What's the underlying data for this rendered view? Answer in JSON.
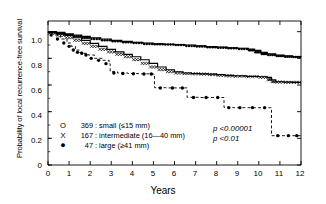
{
  "chart_data": {
    "type": "line",
    "title": "",
    "xlabel": "Years",
    "ylabel": "Probability of local recurrence-free survival",
    "xlim": [
      0,
      12
    ],
    "ylim": [
      0,
      1.08
    ],
    "xticks": [
      "0",
      "1",
      "2",
      "3",
      "4",
      "5",
      "6",
      "7",
      "8",
      "9",
      "10",
      "11",
      "12"
    ],
    "yticks": [
      "0",
      "0.2",
      "0.4",
      "0.6",
      "0.8",
      "1.0"
    ],
    "grid": false,
    "legend_position": "lower-left-inside",
    "series": [
      {
        "name": "small",
        "marker": "O",
        "count": 369,
        "size_range": "≤15 mm",
        "legend_label": "369: small (≤15 mm)",
        "points": [
          [
            0.0,
            1.0
          ],
          [
            0.4,
            0.995
          ],
          [
            0.8,
            0.985
          ],
          [
            1.2,
            0.975
          ],
          [
            1.6,
            0.965
          ],
          [
            2.0,
            0.955
          ],
          [
            2.5,
            0.945
          ],
          [
            3.0,
            0.935
          ],
          [
            3.5,
            0.928
          ],
          [
            4.0,
            0.921
          ],
          [
            4.5,
            0.915
          ],
          [
            5.0,
            0.908
          ],
          [
            5.5,
            0.905
          ],
          [
            6.0,
            0.903
          ],
          [
            6.5,
            0.9
          ],
          [
            7.0,
            0.893
          ],
          [
            7.5,
            0.888
          ],
          [
            8.0,
            0.884
          ],
          [
            8.5,
            0.88
          ],
          [
            9.0,
            0.876
          ],
          [
            9.5,
            0.87
          ],
          [
            9.8,
            0.86
          ],
          [
            10.1,
            0.845
          ],
          [
            10.4,
            0.833
          ],
          [
            10.8,
            0.825
          ],
          [
            11.2,
            0.818
          ],
          [
            11.6,
            0.812
          ],
          [
            12.0,
            0.81
          ]
        ]
      },
      {
        "name": "intermediate",
        "marker": "X",
        "count": 167,
        "size_range": "16—40 mm",
        "legend_label": "167: intermediate (16—40 mm)",
        "points": [
          [
            0.0,
            1.0
          ],
          [
            0.4,
            0.988
          ],
          [
            0.8,
            0.972
          ],
          [
            1.2,
            0.955
          ],
          [
            1.6,
            0.935
          ],
          [
            2.0,
            0.912
          ],
          [
            2.4,
            0.89
          ],
          [
            2.8,
            0.868
          ],
          [
            3.2,
            0.848
          ],
          [
            3.6,
            0.83
          ],
          [
            4.0,
            0.812
          ],
          [
            4.4,
            0.79
          ],
          [
            4.8,
            0.762
          ],
          [
            5.2,
            0.735
          ],
          [
            5.6,
            0.715
          ],
          [
            6.0,
            0.7
          ],
          [
            6.4,
            0.69
          ],
          [
            6.8,
            0.686
          ],
          [
            7.2,
            0.684
          ],
          [
            7.6,
            0.682
          ],
          [
            8.0,
            0.678
          ],
          [
            8.4,
            0.672
          ],
          [
            8.8,
            0.668
          ],
          [
            9.4,
            0.665
          ],
          [
            10.0,
            0.662
          ],
          [
            10.4,
            0.658
          ],
          [
            10.6,
            0.64
          ],
          [
            10.8,
            0.625
          ],
          [
            11.2,
            0.622
          ],
          [
            11.6,
            0.62
          ],
          [
            12.0,
            0.62
          ]
        ]
      },
      {
        "name": "large",
        "marker": "●",
        "count": 47,
        "size_range": "≥41 mm",
        "legend_label": "47: large (≥41 mm)",
        "points": [
          [
            0.0,
            1.0
          ],
          [
            0.3,
            0.975
          ],
          [
            0.6,
            0.945
          ],
          [
            0.9,
            0.915
          ],
          [
            1.1,
            0.89
          ],
          [
            1.3,
            0.862
          ],
          [
            1.5,
            0.845
          ],
          [
            1.7,
            0.838
          ],
          [
            1.9,
            0.825
          ],
          [
            2.2,
            0.8
          ],
          [
            2.6,
            0.785
          ],
          [
            2.9,
            0.76
          ],
          [
            2.95,
            0.7
          ],
          [
            3.3,
            0.69
          ],
          [
            3.8,
            0.686
          ],
          [
            4.3,
            0.684
          ],
          [
            4.8,
            0.682
          ],
          [
            5.0,
            0.682
          ],
          [
            5.05,
            0.58
          ],
          [
            5.6,
            0.578
          ],
          [
            6.2,
            0.578
          ],
          [
            6.55,
            0.578
          ],
          [
            6.6,
            0.508
          ],
          [
            7.2,
            0.506
          ],
          [
            7.8,
            0.506
          ],
          [
            8.3,
            0.506
          ],
          [
            8.35,
            0.432
          ],
          [
            8.8,
            0.43
          ],
          [
            9.4,
            0.43
          ],
          [
            10.0,
            0.43
          ],
          [
            10.55,
            0.43
          ],
          [
            10.6,
            0.22
          ],
          [
            11.2,
            0.22
          ],
          [
            12.0,
            0.22
          ]
        ]
      }
    ],
    "annotations": [
      {
        "text": "p <0.00001",
        "x": 8.35,
        "y": 0.3
      },
      {
        "text": "p <0.01",
        "x": 8.35,
        "y": 0.235
      }
    ]
  },
  "legend": {
    "rows": [
      {
        "marker": "O",
        "count": "369",
        "text": ": small (≤15 mm)"
      },
      {
        "marker": "X",
        "count": "167",
        "text": ": intermediate (16—40 mm)"
      },
      {
        "marker": "●",
        "count": "47",
        "text": ": large (≥41 mm)"
      }
    ]
  },
  "axes": {
    "x_title": "Years",
    "y_title": "Probability of local recurrence-free survival",
    "x_ticks": [
      "0",
      "1",
      "2",
      "3",
      "4",
      "5",
      "6",
      "7",
      "8",
      "9",
      "10",
      "11",
      "12"
    ],
    "y_ticks": [
      "1.0",
      "0.8",
      "0.6",
      "0.4",
      "0.2",
      "0"
    ]
  },
  "stats": {
    "p1": "p <0.00001",
    "p2": "p <0.01"
  },
  "colors": {
    "line": "#000000",
    "background": "#ffffff"
  }
}
